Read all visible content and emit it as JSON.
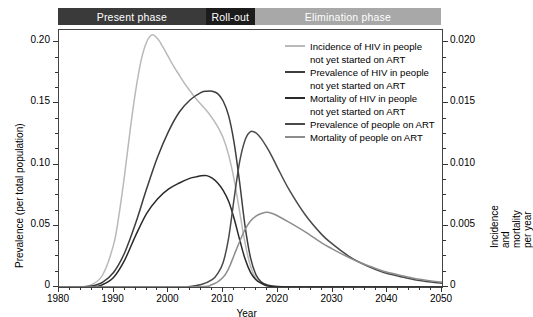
{
  "banner": {
    "segments": [
      {
        "label": "Present phase",
        "color": "#3a3a3a",
        "start_year": 1980,
        "end_year": 2007
      },
      {
        "label": "Roll-out",
        "color": "#1c1c1c",
        "start_year": 2007,
        "end_year": 2016
      },
      {
        "label": "Elimination phase",
        "color": "#a8a8a8",
        "start_year": 2016,
        "end_year": 2050
      }
    ]
  },
  "legend": [
    {
      "label_line1": "Incidence of HIV in people",
      "label_line2": "not yet started on ART",
      "color": "#b9b9b9"
    },
    {
      "label_line1": "Prevalence of HIV in people",
      "label_line2": "not yet started on ART",
      "color": "#3d3d3d"
    },
    {
      "label_line1": "Mortality of HIV in people",
      "label_line2": "not yet started on ART",
      "color": "#2a2a2a"
    },
    {
      "label_line1": "Prevalence of people on ART",
      "label_line2": "",
      "color": "#4a4a4a"
    },
    {
      "label_line1": "Mortality of people on ART",
      "label_line2": "",
      "color": "#8d8d8d"
    }
  ],
  "chart_data": {
    "type": "line",
    "title": "",
    "xlabel": "Year",
    "ylabel": "Prevalence (per total population)",
    "y2label": "Incidence and mortality per year",
    "xlim": [
      1980,
      2050
    ],
    "ylim": [
      0,
      0.21
    ],
    "y2lim": [
      0,
      0.021
    ],
    "xticks": [
      1980,
      1990,
      2000,
      2010,
      2020,
      2030,
      2040,
      2050
    ],
    "xticklabels": [
      "1980",
      "1990",
      "2000",
      "2010",
      "2020",
      "2030",
      "2040",
      "2050"
    ],
    "yticks": [
      0,
      0.05,
      0.1,
      0.15,
      0.2
    ],
    "yticklabels": [
      "0",
      "0.05",
      "0.10",
      "0.15",
      "0.20"
    ],
    "y2ticks": [
      0,
      0.005,
      0.01,
      0.015,
      0.02
    ],
    "y2ticklabels": [
      "0",
      "0.005",
      "0.010",
      "0.015",
      "0.020"
    ],
    "minor_tick_interval_x": 2,
    "grid": false,
    "legend_position": "upper right",
    "series": [
      {
        "name": "Incidence of HIV in people not yet started on ART",
        "axis": "right",
        "color": "#b9b9b9",
        "x": [
          1980,
          1982,
          1984,
          1986,
          1988,
          1990,
          1991,
          1992,
          1993,
          1994,
          1995,
          1996,
          1997,
          1998,
          1999,
          2000,
          2001,
          2002,
          2003,
          2004,
          2005,
          2006,
          2007,
          2008,
          2009,
          2010,
          2011,
          2012,
          2013,
          2014,
          2015,
          2016,
          2017,
          2018,
          2020,
          2025,
          2030,
          2040,
          2050
        ],
        "y": [
          0,
          0,
          0,
          0.0002,
          0.001,
          0.0035,
          0.006,
          0.0092,
          0.0128,
          0.016,
          0.0185,
          0.02,
          0.0206,
          0.0203,
          0.0196,
          0.0188,
          0.018,
          0.0173,
          0.0166,
          0.016,
          0.0154,
          0.0149,
          0.0144,
          0.0138,
          0.0131,
          0.0122,
          0.0108,
          0.0088,
          0.0062,
          0.0036,
          0.0017,
          0.0007,
          0.0003,
          0.0001,
          0,
          0,
          0,
          0,
          0
        ]
      },
      {
        "name": "Prevalence of HIV in people not yet started on ART",
        "axis": "left",
        "color": "#3d3d3d",
        "x": [
          1980,
          1984,
          1986,
          1988,
          1990,
          1992,
          1994,
          1996,
          1998,
          2000,
          2002,
          2004,
          2006,
          2007,
          2008,
          2009,
          2010,
          2011,
          2012,
          2013,
          2014,
          2015,
          2016,
          2017,
          2018,
          2020,
          2025,
          2030,
          2040,
          2050
        ],
        "y": [
          0,
          0,
          0.0008,
          0.004,
          0.012,
          0.028,
          0.052,
          0.08,
          0.106,
          0.127,
          0.143,
          0.153,
          0.159,
          0.16,
          0.16,
          0.158,
          0.152,
          0.14,
          0.118,
          0.086,
          0.05,
          0.024,
          0.01,
          0.004,
          0.0018,
          0.0005,
          0,
          0,
          0,
          0
        ]
      },
      {
        "name": "Mortality of HIV in people not yet started on ART",
        "axis": "right",
        "color": "#2a2a2a",
        "x": [
          1980,
          1986,
          1988,
          1990,
          1992,
          1994,
          1996,
          1998,
          2000,
          2002,
          2004,
          2005,
          2006,
          2007,
          2008,
          2009,
          2010,
          2011,
          2012,
          2013,
          2014,
          2015,
          2016,
          2017,
          2018,
          2020,
          2025,
          2030,
          2040,
          2050
        ],
        "y": [
          0,
          0,
          0.0002,
          0.0008,
          0.0022,
          0.0042,
          0.006,
          0.0072,
          0.008,
          0.0085,
          0.0089,
          0.009,
          0.0091,
          0.0091,
          0.0089,
          0.0085,
          0.0079,
          0.007,
          0.0056,
          0.0039,
          0.0023,
          0.0012,
          0.0006,
          0.0003,
          0.0001,
          0,
          0,
          0,
          0,
          0
        ]
      },
      {
        "name": "Prevalence of people on ART",
        "axis": "left",
        "color": "#4a4a4a",
        "x": [
          1980,
          2000,
          2004,
          2006,
          2008,
          2009,
          2010,
          2011,
          2012,
          2013,
          2014,
          2015,
          2016,
          2017,
          2018,
          2019,
          2020,
          2022,
          2025,
          2028,
          2030,
          2033,
          2035,
          2038,
          2040,
          2043,
          2045,
          2048,
          2050
        ],
        "y": [
          0,
          0,
          0.0005,
          0.002,
          0.006,
          0.011,
          0.02,
          0.04,
          0.072,
          0.102,
          0.12,
          0.127,
          0.126,
          0.121,
          0.114,
          0.106,
          0.097,
          0.08,
          0.059,
          0.043,
          0.035,
          0.025,
          0.02,
          0.014,
          0.011,
          0.008,
          0.006,
          0.004,
          0.003
        ]
      },
      {
        "name": "Mortality of people on ART",
        "axis": "right",
        "color": "#8d8d8d",
        "x": [
          1980,
          2004,
          2008,
          2010,
          2011,
          2012,
          2013,
          2014,
          2015,
          2016,
          2017,
          2018,
          2019,
          2020,
          2022,
          2025,
          2028,
          2030,
          2033,
          2035,
          2038,
          2040,
          2043,
          2045,
          2048,
          2050
        ],
        "y": [
          0,
          0,
          0.0002,
          0.0008,
          0.0015,
          0.0026,
          0.0037,
          0.0047,
          0.0054,
          0.0058,
          0.006,
          0.0061,
          0.006,
          0.0058,
          0.0053,
          0.0045,
          0.0036,
          0.0031,
          0.0024,
          0.002,
          0.0015,
          0.0012,
          0.0009,
          0.0007,
          0.0005,
          0.0004
        ]
      }
    ]
  }
}
